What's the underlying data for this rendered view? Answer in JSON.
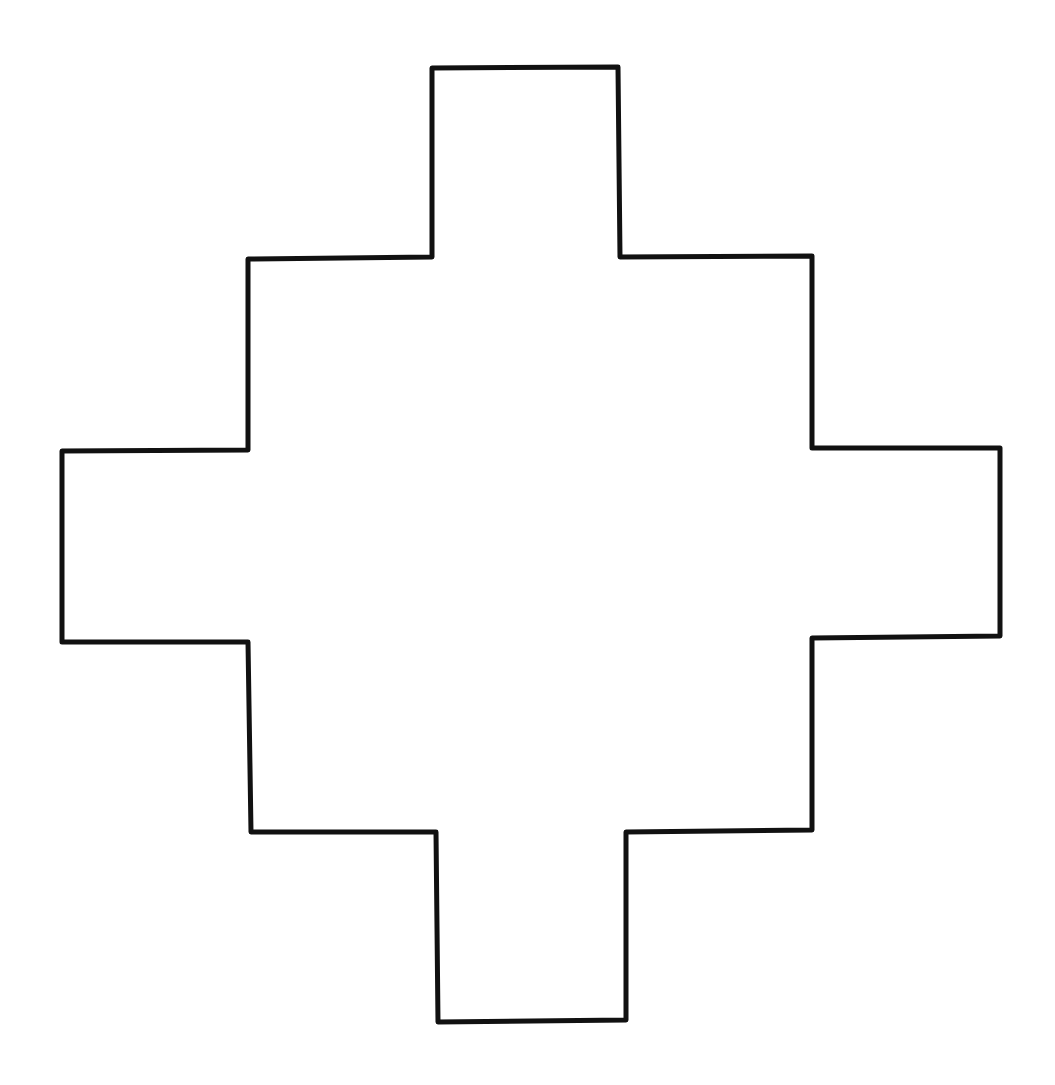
{
  "figure": {
    "shape": "stepped-cross",
    "background_color": "#ffffff",
    "stroke_color": "#111111",
    "fill_color": "none",
    "stroke_width": 5,
    "points": [
      [
        432,
        68
      ],
      [
        618,
        67
      ],
      [
        620,
        257
      ],
      [
        812,
        256
      ],
      [
        812,
        448
      ],
      [
        1000,
        448
      ],
      [
        1000,
        636
      ],
      [
        812,
        638
      ],
      [
        812,
        830
      ],
      [
        626,
        832
      ],
      [
        626,
        1020
      ],
      [
        438,
        1022
      ],
      [
        436,
        832
      ],
      [
        251,
        832
      ],
      [
        248,
        642
      ],
      [
        62,
        642
      ],
      [
        62,
        451
      ],
      [
        248,
        450
      ],
      [
        248,
        259
      ],
      [
        432,
        257
      ]
    ]
  }
}
